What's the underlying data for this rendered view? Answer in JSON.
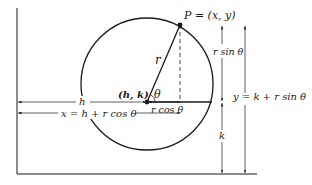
{
  "diagram": {
    "type": "polar-circle-coordinates",
    "colors": {
      "ink": "#1a1a1a",
      "background": "#ffffff"
    },
    "labels": {
      "point_p": "P = (x, y)",
      "center": "(h, k)",
      "radius": "r",
      "angle": "θ",
      "r_sin": "r sin θ",
      "r_cos": "r cos θ",
      "h": "h",
      "k": "k",
      "x_eq": "x = h + r cos θ",
      "y_eq": "y = k + r sin θ"
    }
  }
}
